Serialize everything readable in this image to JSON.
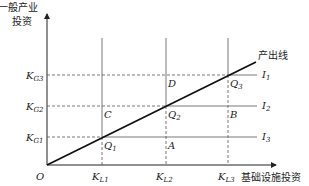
{
  "diagram": {
    "y_axis_label_line1": "一般产业",
    "y_axis_label_line2": "投资",
    "x_axis_label": "基础设施投资",
    "origin_label": "O",
    "output_line_label": "产出线",
    "y_ticks": [
      {
        "main": "K",
        "sub": "G3"
      },
      {
        "main": "K",
        "sub": "G2"
      },
      {
        "main": "K",
        "sub": "G1"
      }
    ],
    "x_ticks": [
      {
        "main": "K",
        "sub": "L1"
      },
      {
        "main": "K",
        "sub": "L2"
      },
      {
        "main": "K",
        "sub": "L3"
      }
    ],
    "isoquants": [
      {
        "main": "I",
        "sub": "1"
      },
      {
        "main": "I",
        "sub": "2"
      },
      {
        "main": "I",
        "sub": "3"
      }
    ],
    "points": {
      "Q1": {
        "main": "Q",
        "sub": "1"
      },
      "Q2": {
        "main": "Q",
        "sub": "2"
      },
      "Q3": {
        "main": "Q",
        "sub": "3"
      },
      "A": "A",
      "B": "B",
      "C": "C",
      "D": "D"
    },
    "caption": "基础设施投资与一般产业投资的关系"
  },
  "colors": {
    "line": "#222222",
    "thin_line": "#555555",
    "background": "#ffffff"
  }
}
